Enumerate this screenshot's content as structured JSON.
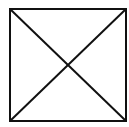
{
  "diagram": {
    "shape": "square-with-diagonals",
    "square": {
      "x": 10,
      "y": 9,
      "width": 116,
      "height": 112
    },
    "diagonals": [
      {
        "from": "top-left",
        "to": "bottom-right"
      },
      {
        "from": "bottom-left",
        "to": "top-right"
      }
    ],
    "stroke_color": "#111111",
    "stroke_width": 2,
    "background": "#ffffff"
  }
}
